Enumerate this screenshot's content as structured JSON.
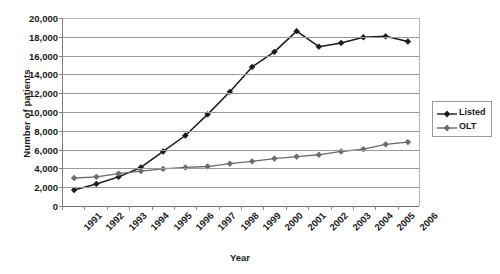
{
  "chart_data": {
    "type": "line",
    "title": "",
    "xlabel": "Year",
    "ylabel": "Number of patients",
    "categories": [
      "1991",
      "1992",
      "1993",
      "1994",
      "1995",
      "1996",
      "1997",
      "1998",
      "1999",
      "2000",
      "2001",
      "2002",
      "2003",
      "2004",
      "2005",
      "2006"
    ],
    "x_tick_labels": [
      "1991",
      "1992",
      "1993",
      "1994",
      "1995",
      "1996",
      "1997",
      "1998",
      "1999",
      "2000",
      "2001",
      "2002",
      "2003",
      "2004",
      "2005",
      "2006"
    ],
    "y_tick_labels": [
      "0",
      "2,000",
      "4,000",
      "6,000",
      "8,000",
      "10,000",
      "12,000",
      "14,000",
      "16,000",
      "18,000",
      "20,000"
    ],
    "y_tick_values": [
      0,
      2000,
      4000,
      6000,
      8000,
      10000,
      12000,
      14000,
      16000,
      18000,
      20000
    ],
    "ylim": [
      0,
      20000
    ],
    "grid": true,
    "legend_position": "right",
    "series": [
      {
        "name": "Listed",
        "color": "#1a1a1a",
        "marker": "diamond",
        "values": [
          1700,
          2350,
          3100,
          4100,
          5800,
          7500,
          9750,
          12150,
          14800,
          16400,
          18600,
          16950,
          17350,
          17950,
          18050,
          17500
        ]
      },
      {
        "name": "OLT",
        "color": "#6b6b6b",
        "marker": "diamond",
        "values": [
          2980,
          3100,
          3450,
          3700,
          3950,
          4100,
          4200,
          4500,
          4750,
          5050,
          5250,
          5450,
          5800,
          6050,
          6550,
          6800
        ]
      }
    ]
  },
  "legend": {
    "entries": [
      {
        "label": "Listed"
      },
      {
        "label": "OLT"
      }
    ]
  },
  "colors": {
    "listed": "#1a1a1a",
    "olt": "#6b6b6b",
    "gridline": "#9a9a9a",
    "axis": "#6e6e6e",
    "text": "#1a1a1a",
    "background": "#ffffff"
  }
}
